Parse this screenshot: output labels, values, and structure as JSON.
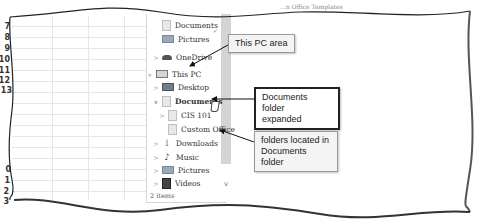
{
  "window": {
    "top_text": "...n Office Templates"
  },
  "spreadsheet": {
    "row_numbers_top": [
      "7",
      "8",
      "9",
      "10",
      "11",
      "12",
      "13"
    ],
    "row_numbers_bottom": [
      "0",
      "1",
      "2",
      "3"
    ]
  },
  "navigation_pane": {
    "items": [
      {
        "label": "Documents",
        "icon": "folder-icon",
        "chevron": "",
        "pinned": true
      },
      {
        "label": "Pictures",
        "icon": "pictures-icon",
        "chevron": ""
      },
      {
        "label": "OneDrive",
        "icon": "onedrive-cloud-icon",
        "chevron": ">"
      },
      {
        "label": "This PC",
        "icon": "computer-icon",
        "chevron": "v"
      },
      {
        "label": "Desktop",
        "icon": "desktop-icon",
        "chevron": ">"
      },
      {
        "label": "Documents",
        "icon": "documents-folder-icon",
        "chevron": "v"
      },
      {
        "label": "CIS 101",
        "icon": "folder-icon",
        "chevron": ">"
      },
      {
        "label": "Custom Office",
        "icon": "folder-icon",
        "chevron": ""
      },
      {
        "label": "Downloads",
        "icon": "download-icon",
        "chevron": ">"
      },
      {
        "label": "Music",
        "icon": "music-icon",
        "chevron": ">"
      },
      {
        "label": "Pictures",
        "icon": "pictures-icon",
        "chevron": ">"
      },
      {
        "label": "Videos",
        "icon": "videos-icon",
        "chevron": ">"
      }
    ],
    "pin_glyph": "✓",
    "scroll_down_glyph": "v"
  },
  "status_bar": {
    "item_count": "2 items"
  },
  "callouts": {
    "this_pc": "This PC area",
    "documents_expanded_line1": "Documents folder",
    "documents_expanded_line2": "expanded",
    "folders_line1": "folders located in",
    "folders_line2": "Documents folder"
  }
}
